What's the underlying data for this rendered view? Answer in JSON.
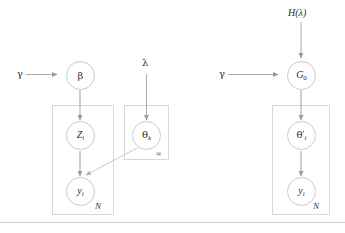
{
  "figure": {
    "type": "graphical-model-plate-diagram",
    "panel_count": 2,
    "stroke_color": "#a9a9b0",
    "plate_color": "#d8d8dc",
    "node_fill": "#ffffff"
  },
  "left_panel": {
    "name": "finite-mixture-model",
    "hyper_labels": {
      "gamma": "γ",
      "lambda": "λ"
    },
    "nodes": [
      {
        "id": "beta",
        "label_main": "β",
        "label_sub": "",
        "prime": false
      },
      {
        "id": "z_i",
        "label_main": "Z",
        "label_sub": "i",
        "prime": false
      },
      {
        "id": "theta_k",
        "label_main": "θ",
        "label_sub": "k",
        "prime": false
      },
      {
        "id": "y_i",
        "label_main": "y",
        "label_sub": "i",
        "prime": false
      }
    ],
    "plates": [
      {
        "id": "plate-n",
        "label": "N"
      },
      {
        "id": "plate-infinity",
        "label": "∞"
      }
    ]
  },
  "right_panel": {
    "name": "dirichlet-process-model",
    "hyper_labels": {
      "h_lambda": "H(λ)",
      "gamma": "γ"
    },
    "nodes": [
      {
        "id": "g0",
        "label_main": "G",
        "label_sub": "0",
        "prime": false
      },
      {
        "id": "theta_i_pr",
        "label_main": "θ",
        "label_sub": "i",
        "prime": true
      },
      {
        "id": "y_i",
        "label_main": "y",
        "label_sub": "i",
        "prime": false
      }
    ],
    "plates": [
      {
        "id": "plate-n",
        "label": "N"
      }
    ]
  }
}
